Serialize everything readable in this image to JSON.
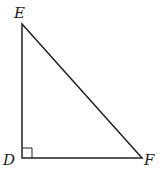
{
  "diagram": {
    "type": "right-triangle",
    "vertices": [
      {
        "id": "E",
        "label": "E",
        "x": 22,
        "y": 24,
        "label_x": 14,
        "label_y": 18
      },
      {
        "id": "D",
        "label": "D",
        "x": 22,
        "y": 158,
        "label_x": 3,
        "label_y": 165
      },
      {
        "id": "F",
        "label": "F",
        "x": 142,
        "y": 158,
        "label_x": 144,
        "label_y": 165
      }
    ],
    "right_angle_at": "D",
    "right_angle_size": 10,
    "stroke_color": "#222222"
  }
}
